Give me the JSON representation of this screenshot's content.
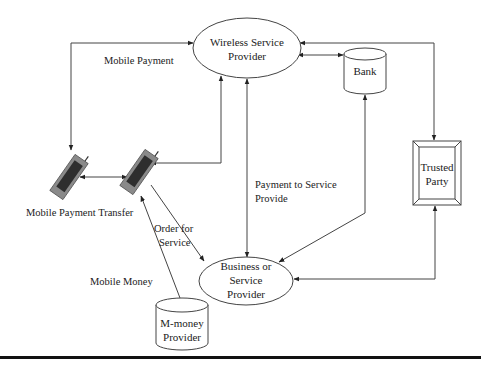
{
  "diagram": {
    "nodes": {
      "wireless": {
        "line1": "Wireless Service",
        "line2": "Provider"
      },
      "bank": {
        "label": "Bank"
      },
      "trusted": {
        "line1": "Trusted",
        "line2": "Party"
      },
      "business": {
        "line1": "Business or",
        "line2": "Service",
        "line3": "Provider"
      },
      "mmoney": {
        "line1": "M-money",
        "line2": "Provider"
      },
      "phone_sender": {
        "label": "Mobile Payment Transfer"
      },
      "phone_receiver": {
        "label": ""
      }
    },
    "edge_labels": {
      "mobile_payment": "Mobile Payment",
      "payment_to_service_line1": "Payment to Service",
      "payment_to_service_line2": "Provide",
      "order_line1": "Order for",
      "order_line2": "Service",
      "mobile_money": "Mobile Money"
    },
    "colors": {
      "line": "#444444",
      "phone_body": "#8a8a8a",
      "phone_screen": "#2e2e2e"
    }
  }
}
